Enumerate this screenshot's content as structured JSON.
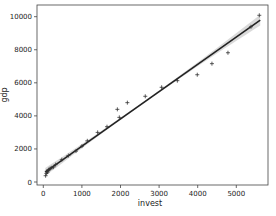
{
  "chart_data": {
    "type": "scatter",
    "title": "",
    "xlabel": "invest",
    "ylabel": "gdp",
    "xlim": [
      -200,
      5800
    ],
    "ylim": [
      -200,
      10600
    ],
    "xticks": [
      0,
      1000,
      2000,
      3000,
      4000,
      5000
    ],
    "yticks": [
      0,
      2000,
      4000,
      6000,
      8000,
      10000
    ],
    "xtick_labels": [
      "0",
      "1000",
      "2000",
      "3000",
      "4000",
      "5000"
    ],
    "ytick_labels": [
      "0",
      "2000",
      "4000",
      "6000",
      "8000",
      "10000"
    ],
    "grid": false,
    "legend": null,
    "marker": "+",
    "series": [
      {
        "name": "observations",
        "points": [
          [
            60,
            380
          ],
          [
            80,
            520
          ],
          [
            90,
            650
          ],
          [
            110,
            600
          ],
          [
            130,
            700
          ],
          [
            150,
            760
          ],
          [
            180,
            820
          ],
          [
            220,
            860
          ],
          [
            260,
            900
          ],
          [
            320,
            1050
          ],
          [
            480,
            1350
          ],
          [
            650,
            1600
          ],
          [
            847,
            1870
          ],
          [
            1002,
            2170
          ],
          [
            1140,
            2490
          ],
          [
            1408,
            3000
          ],
          [
            1650,
            3345
          ],
          [
            1919,
            4395
          ],
          [
            1970,
            3910
          ],
          [
            2178,
            4800
          ],
          [
            2642,
            5185
          ],
          [
            3066,
            5730
          ],
          [
            3473,
            6130
          ],
          [
            3989,
            6490
          ],
          [
            4369,
            7160
          ],
          [
            4784,
            7820
          ],
          [
            5380,
            9390
          ],
          [
            5596,
            10085
          ]
        ]
      },
      {
        "name": "regression fit",
        "type": "line",
        "slope": 1.65,
        "intercept": 520,
        "x_range": [
          50,
          5620
        ],
        "confidence_band": true
      }
    ]
  }
}
